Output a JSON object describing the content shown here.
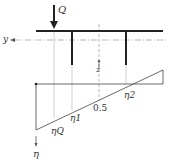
{
  "labels": {
    "load": "Q",
    "y_axis": "y",
    "z_axis": "z",
    "eta_axis": "η",
    "eta_q": "ηQ",
    "eta_1": "η1",
    "eta_2": "η2",
    "mid_value": "0.5"
  },
  "colors": {
    "line": "#222222",
    "guide": "#aaaaaa"
  }
}
